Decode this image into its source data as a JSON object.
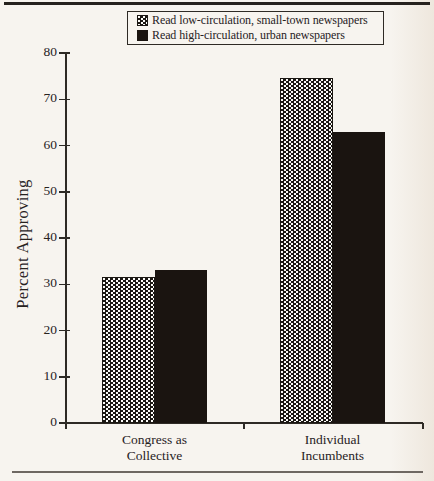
{
  "figure_type": "scanned-book-bar-chart",
  "legend": {
    "items": [
      {
        "icon": "hatched-swatch-icon",
        "style": "hatched",
        "label": "Read low-circulation, small-town newspapers"
      },
      {
        "icon": "solid-swatch-icon",
        "style": "solid",
        "label": "Read high-circulation, urban newspapers"
      }
    ]
  },
  "chart_data": {
    "type": "bar",
    "title": "",
    "xlabel": "",
    "ylabel": "Percent Approving",
    "ylim": [
      0,
      80
    ],
    "yticks": [
      0,
      10,
      20,
      30,
      40,
      50,
      60,
      70,
      80
    ],
    "grid": false,
    "legend_position": "top",
    "categories": [
      "Congress as Collective",
      "Individual Incumbents"
    ],
    "category_label_lines": [
      [
        "Congress as",
        "Collective"
      ],
      [
        "Individual",
        "Incumbents"
      ]
    ],
    "series": [
      {
        "name": "Read low-circulation, small-town newspapers",
        "style": "hatched",
        "values": [
          31.5,
          74.5
        ]
      },
      {
        "name": "Read high-circulation, urban newspapers",
        "style": "solid",
        "values": [
          33,
          63
        ]
      }
    ]
  },
  "colors": {
    "paper": "#f7f4ef",
    "paper_edge": "#eee7dd",
    "ink": "#27221e",
    "axis": "#2e2a25",
    "solid_bar": "#1a1410",
    "hatch_fg": "#1b1713",
    "hatch_bg": "#fcfbf8",
    "top_rule": "#26221e",
    "bottom_rule": "#6e6862"
  }
}
